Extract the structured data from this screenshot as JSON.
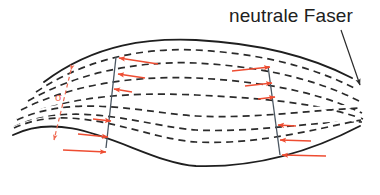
{
  "figure": {
    "kind": "engineering-diagram",
    "background_color": "#ffffff",
    "outline_color": "#1f1f1f",
    "fiber_color": "#2b2b2b",
    "arrow_color": "#ee4d32",
    "dimension_color": "#ef6a52",
    "leader_color": "#2b2b2b"
  },
  "labels": {
    "neutral_fiber": "neutrale Faser",
    "height_dimension": "σ",
    "bottom_caption": ""
  },
  "beam": {
    "top_edge": "curved solid line, sagging downward",
    "bottom_edge": "curved solid line, sagging downward",
    "internal_fibers_count": 5,
    "fiber_style": "dashed",
    "neutral_fiber_index": 2,
    "section_lines": [
      {
        "name": "left-section-cut",
        "style": "solid thin"
      },
      {
        "name": "right-section-cut",
        "style": "solid thin"
      }
    ]
  },
  "arrows": {
    "left_block": [
      {
        "level": "top",
        "direction": "left",
        "length_rel": 1.0
      },
      {
        "level": "upper",
        "direction": "left",
        "length_rel": 0.66
      },
      {
        "level": "upper-mid",
        "direction": "left",
        "length_rel": 0.32
      },
      {
        "level": "neutral",
        "direction": "none",
        "length_rel": 0.0
      },
      {
        "level": "lower-mid",
        "direction": "right",
        "length_rel": 0.32
      },
      {
        "level": "lower",
        "direction": "right",
        "length_rel": 0.66
      },
      {
        "level": "bottom",
        "direction": "right",
        "length_rel": 1.0
      }
    ],
    "right_block": [
      {
        "level": "top",
        "direction": "right",
        "length_rel": 1.0
      },
      {
        "level": "upper",
        "direction": "right",
        "length_rel": 0.66
      },
      {
        "level": "upper-mid",
        "direction": "right",
        "length_rel": 0.32
      },
      {
        "level": "neutral",
        "direction": "none",
        "length_rel": 0.0
      },
      {
        "level": "lower-mid",
        "direction": "left",
        "length_rel": 0.32
      },
      {
        "level": "lower",
        "direction": "left",
        "length_rel": 0.66
      },
      {
        "level": "bottom",
        "direction": "left",
        "length_rel": 1.0
      }
    ],
    "note": "compression above neutral fiber, tension below"
  },
  "dimension": {
    "name": "stress-height-dimension",
    "style": "dashed double arrow, vertical",
    "label": "σ"
  }
}
